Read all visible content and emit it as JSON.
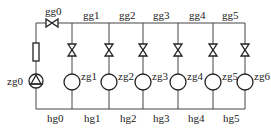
{
  "diagram": {
    "type": "piping-network",
    "supply_valve": {
      "label": "gg0"
    },
    "pump": {
      "label": "zg0"
    },
    "top_segments": [
      "gg1",
      "gg2",
      "gg3",
      "gg4",
      "gg5"
    ],
    "bottom_segments": [
      "hg0",
      "hg1",
      "hg2",
      "hg3",
      "hg4",
      "hg5"
    ],
    "branches": [
      {
        "label": "zg1"
      },
      {
        "label": "zg2"
      },
      {
        "label": "zg3"
      },
      {
        "label": "zg4"
      },
      {
        "label": "zg5"
      },
      {
        "label": "zg6"
      }
    ]
  }
}
